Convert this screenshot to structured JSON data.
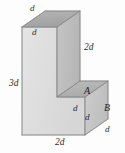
{
  "figure": {
    "kind": "l-shaped-solid",
    "background_color": "#fdfdfd",
    "colors": {
      "top_face": "#a9a9a9",
      "upper_right_face": "#bdbdbd",
      "front_face": "#dedede",
      "lower_right_face": "#c6c6c6",
      "step_top_face": "#b4b4b4",
      "outline": "#8c8c8c",
      "label_text": "#2b2b2b"
    },
    "faces": [
      {
        "id": "top-face",
        "name": "top-face",
        "fill": "#a9a9a9",
        "points": "22,27 45,11 80,11 57,27"
      },
      {
        "id": "upper-right-face",
        "name": "upper-right-face",
        "fill": "#bdbdbd",
        "points": "57,27 80,11 80,97 57,97"
      },
      {
        "id": "front-face",
        "name": "front-face",
        "fill": "#dedede",
        "points": "22,27 57,27 57,97 85,97 85,135 22,135"
      },
      {
        "id": "step-top-face",
        "name": "step-top-face",
        "fill": "#b4b4b4",
        "points": "57,97 80,81 108,81 85,97"
      },
      {
        "id": "lower-right-face",
        "name": "lower-right-face",
        "fill": "#c6c6c6",
        "points": "85,97 108,81 108,119 85,135"
      }
    ],
    "edges": [
      {
        "name": "top-back-left-edge",
        "x1": 22,
        "y1": 27,
        "x2": 45,
        "y2": 11
      },
      {
        "name": "top-back-edge",
        "x1": 45,
        "y1": 11,
        "x2": 80,
        "y2": 11
      },
      {
        "name": "top-front-edge",
        "x1": 22,
        "y1": 27,
        "x2": 57,
        "y2": 27
      },
      {
        "name": "top-right-edge",
        "x1": 57,
        "y1": 27,
        "x2": 80,
        "y2": 11
      },
      {
        "name": "vertical-left-edge",
        "x1": 22,
        "y1": 27,
        "x2": 22,
        "y2": 135
      },
      {
        "name": "vertical-mid-edge",
        "x1": 57,
        "y1": 27,
        "x2": 57,
        "y2": 97
      },
      {
        "name": "vertical-back-edge",
        "x1": 80,
        "y1": 11,
        "x2": 80,
        "y2": 81
      },
      {
        "name": "step-inner-edge",
        "x1": 57,
        "y1": 97,
        "x2": 85,
        "y2": 97
      },
      {
        "name": "step-top-back-edge",
        "x1": 80,
        "y1": 81,
        "x2": 108,
        "y2": 81
      },
      {
        "name": "step-diagonal-left",
        "x1": 57,
        "y1": 97,
        "x2": 80,
        "y2": 81
      },
      {
        "name": "step-diagonal-right",
        "x1": 85,
        "y1": 97,
        "x2": 108,
        "y2": 81
      },
      {
        "name": "vertical-right-edge",
        "x1": 108,
        "y1": 81,
        "x2": 108,
        "y2": 119
      },
      {
        "name": "vertical-step-edge",
        "x1": 85,
        "y1": 97,
        "x2": 85,
        "y2": 135
      },
      {
        "name": "bottom-front-edge",
        "x1": 22,
        "y1": 135,
        "x2": 85,
        "y2": 135
      },
      {
        "name": "bottom-diagonal-edge",
        "x1": 85,
        "y1": 135,
        "x2": 108,
        "y2": 119
      }
    ],
    "labels": [
      {
        "id": "label-d-top",
        "name": "label-d-top",
        "text": "d",
        "x": 30,
        "y": 4,
        "size": "sm"
      },
      {
        "id": "label-d-top-front",
        "name": "label-d-top-front",
        "text": "d",
        "x": 32,
        "y": 28,
        "size": "sm"
      },
      {
        "id": "label-2d-right",
        "name": "label-2d-right",
        "text": "2d",
        "x": 84,
        "y": 43,
        "size": "md"
      },
      {
        "id": "label-3d-left",
        "name": "label-3d-left",
        "text": "3d",
        "x": 9,
        "y": 79,
        "size": "md"
      },
      {
        "id": "label-a",
        "name": "label-face-a",
        "text": "A",
        "x": 84,
        "y": 86,
        "size": "cap"
      },
      {
        "id": "label-d-step-left",
        "name": "label-d-step-left",
        "text": "d",
        "x": 73,
        "y": 104,
        "size": "sm"
      },
      {
        "id": "label-d-step-low",
        "name": "label-d-step-lower",
        "text": "d",
        "x": 85,
        "y": 113,
        "size": "sm"
      },
      {
        "id": "label-b",
        "name": "label-face-b",
        "text": "B",
        "x": 104,
        "y": 103,
        "size": "cap"
      },
      {
        "id": "label-d-bottom-rt",
        "name": "label-d-bottom-right",
        "text": "d",
        "x": 105,
        "y": 125,
        "size": "sm"
      },
      {
        "id": "label-2d-bottom",
        "name": "label-2d-bottom",
        "text": "2d",
        "x": 55,
        "y": 138,
        "size": "md"
      }
    ]
  }
}
